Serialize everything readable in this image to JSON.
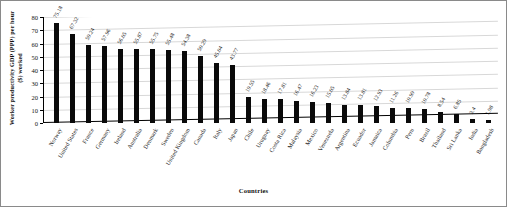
{
  "chart_data": {
    "type": "bar",
    "title": "",
    "xlabel": "Countries",
    "ylabel": "Worker productivity GDP (PPP) per hour ($) worked",
    "ylim": [
      0,
      80
    ],
    "yticks": [
      0,
      10,
      20,
      30,
      40,
      50,
      60,
      70,
      80
    ],
    "grid": true,
    "legend": "none",
    "bar_color": "#0a0a0a",
    "categories": [
      "Norway",
      "United States",
      "France",
      "Germany",
      "Ireland",
      "Australia",
      "Denmark",
      "Sweden",
      "United Kingdom",
      "Canada",
      "Italy",
      "Japan",
      "Chile",
      "Uruguay",
      "Costa Rica",
      "Malaysia",
      "Mexico",
      "Venezuela",
      "Argentina",
      "Ecuador",
      "Jamaica",
      "Columbia",
      "Peru",
      "Brazil",
      "Thailand",
      "Sri Lanka",
      "India",
      "Bangladesh"
    ],
    "values": [
      75.18,
      67.32,
      59.24,
      57.96,
      56.05,
      55.87,
      55.75,
      55.48,
      54.38,
      50.29,
      45.04,
      43.77,
      19.55,
      18.46,
      17.81,
      16.47,
      16.23,
      15.05,
      13.84,
      13.81,
      12.93,
      11.26,
      10.99,
      10.78,
      8.54,
      6.85,
      3.4,
      1.98
    ],
    "data_labels": [
      "75.18",
      "67.32",
      "59.24",
      "57.96",
      "56.05",
      "55.87",
      "55.75",
      "55.48",
      "54.38",
      "50.29",
      "45.04",
      "43.77",
      "19.55",
      "18.46",
      "17.81",
      "16.47",
      "16.23",
      "15.05",
      "13.84",
      "13.81",
      "12.93",
      "11.26",
      "10.99",
      "10.78",
      "8.54",
      "6.85",
      "3.4",
      "1.98"
    ]
  }
}
